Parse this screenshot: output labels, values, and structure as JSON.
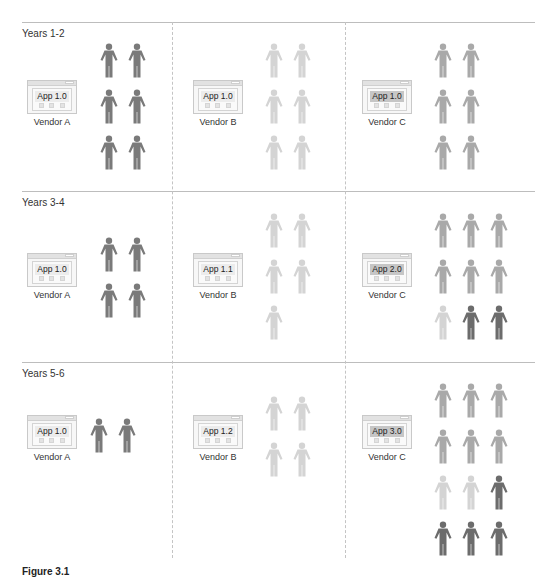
{
  "colors": {
    "dark": "#7a7a7a",
    "mid": "#a9a9a9",
    "light": "#d4d4d4",
    "darker": "#6c6c6c"
  },
  "caption": "Figure 3.1",
  "periods": [
    {
      "label": "Years 1-2",
      "vendors": [
        {
          "vendor": "Vendor A",
          "app": "App 1.0",
          "users": [
            "dark",
            "dark",
            "dark",
            "dark",
            "dark",
            "dark"
          ]
        },
        {
          "vendor": "Vendor B",
          "app": "App 1.0",
          "users": [
            "light",
            "light",
            "light",
            "light",
            "light",
            "light"
          ]
        },
        {
          "vendor": "Vendor C",
          "app": "App 1.0",
          "users": [
            "mid",
            "mid",
            "mid",
            "mid",
            "mid",
            "mid"
          ]
        }
      ]
    },
    {
      "label": "Years 3-4",
      "vendors": [
        {
          "vendor": "Vendor A",
          "app": "App 1.0",
          "users": [
            "dark",
            "dark",
            "dark",
            "dark"
          ]
        },
        {
          "vendor": "Vendor B",
          "app": "App 1.1",
          "users": [
            "light",
            "light",
            "light",
            "light",
            "light"
          ]
        },
        {
          "vendor": "Vendor C",
          "app": "App 2.0",
          "users": [
            "mid",
            "mid",
            "mid",
            "mid",
            "mid",
            "mid",
            "light",
            "darker",
            "darker"
          ]
        }
      ]
    },
    {
      "label": "Years 5-6",
      "vendors": [
        {
          "vendor": "Vendor A",
          "app": "App 1.0",
          "users": [
            "dark",
            "dark"
          ]
        },
        {
          "vendor": "Vendor B",
          "app": "App 1.2",
          "users": [
            "light",
            "light",
            "light",
            "light"
          ]
        },
        {
          "vendor": "Vendor C",
          "app": "App 3.0",
          "users": [
            "mid",
            "mid",
            "mid",
            "mid",
            "mid",
            "mid",
            "light",
            "light",
            "darker",
            "darker",
            "darker",
            "darker"
          ]
        }
      ]
    }
  ]
}
